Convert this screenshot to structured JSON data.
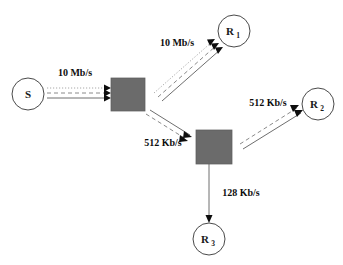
{
  "diagram": {
    "background_color": "#ffffff",
    "router_color": "#6b6b6b",
    "host_border_color": "#4a4a4a",
    "arrow_color": "#0d0d0d"
  },
  "nodes": {
    "source": {
      "id": "S",
      "label": "S",
      "subscript": "",
      "shape": "circle",
      "cx": 28,
      "cy": 94,
      "r": 16
    },
    "router1": {
      "id": "router-1",
      "label": "",
      "shape": "square",
      "x": 111,
      "y": 78,
      "width": 34,
      "height": 33
    },
    "router2": {
      "id": "router-2",
      "label": "",
      "shape": "square",
      "x": 196,
      "y": 130,
      "width": 36,
      "height": 34
    },
    "receiver1": {
      "id": "R1",
      "label": "R",
      "subscript": "1",
      "shape": "circle",
      "cx": 234,
      "cy": 31,
      "r": 16
    },
    "receiver2": {
      "id": "R2",
      "label": "R",
      "subscript": "2",
      "shape": "circle",
      "cx": 318,
      "cy": 104,
      "r": 16
    },
    "receiver3": {
      "id": "R3",
      "label": "R",
      "subscript": "3",
      "shape": "circle",
      "cx": 209,
      "cy": 239,
      "r": 16
    }
  },
  "links": [
    {
      "id": "link-source-router1",
      "from": "S",
      "to": "router-1",
      "bandwidth": "10 Mb/s",
      "label_x": 75,
      "label_y": 76,
      "streams": 3,
      "arrowheads": 3
    },
    {
      "id": "link-router1-receiver1",
      "from": "router-1",
      "to": "R1",
      "bandwidth": "10 Mb/s",
      "label_x": 177,
      "label_y": 46,
      "streams": 3,
      "arrowheads": 3
    },
    {
      "id": "link-router1-router2",
      "from": "router-1",
      "to": "router-2",
      "bandwidth": "512 Kb/s",
      "label_x": 163,
      "label_y": 146,
      "streams": 2,
      "arrowheads": 2
    },
    {
      "id": "link-router2-receiver2",
      "from": "router-2",
      "to": "R2",
      "bandwidth": "512 Kb/s",
      "label_x": 268,
      "label_y": 106,
      "streams": 2,
      "arrowheads": 2
    },
    {
      "id": "link-router2-receiver3",
      "from": "router-2",
      "to": "R3",
      "bandwidth": "128 Kb/s",
      "label_x": 241,
      "label_y": 196,
      "streams": 1,
      "arrowheads": 1
    }
  ]
}
